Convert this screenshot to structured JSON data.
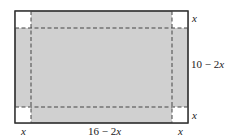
{
  "diagram": {
    "colors": {
      "fill": "#d0d0d0",
      "corner": "#ffffff",
      "stroke": "#333333",
      "dash": "#444444"
    },
    "labels": {
      "top_right_cut": "x",
      "right_height": "10 − 2x",
      "bottom_right_cut": "x",
      "bottom_left_cut": "x",
      "bottom_width": "16 − 2x",
      "bottom_right_width_cut": "x"
    },
    "label_parts": {
      "right_height_num": "10 − 2",
      "right_height_var": "x",
      "bottom_width_num": "16 − 2",
      "bottom_width_var": "x"
    }
  }
}
